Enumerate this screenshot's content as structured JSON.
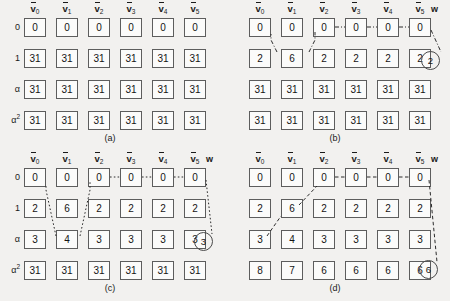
{
  "figure": {
    "background": "#f2f1ef",
    "cell_border": "#5d5d5d",
    "line_color": "#2b2b2b",
    "columns": [
      "0",
      "1",
      "2",
      "3",
      "4",
      "5"
    ],
    "column_symbol": "v",
    "row_labels": [
      "0",
      "1",
      "α",
      "α"
    ],
    "row_label_sup": [
      "",
      "",
      "",
      "2"
    ],
    "w_label": "w"
  },
  "panels": [
    {
      "id": "a",
      "caption": "(a)",
      "show_row_labels": true,
      "show_w": false,
      "circled_value": null,
      "rows": [
        {
          "label": "0",
          "sup": "",
          "values": [
            "0",
            "0",
            "0",
            "0",
            "0",
            "0"
          ]
        },
        {
          "label": "1",
          "sup": "",
          "values": [
            "31",
            "31",
            "31",
            "31",
            "31",
            "31"
          ]
        },
        {
          "label": "α",
          "sup": "",
          "values": [
            "31",
            "31",
            "31",
            "31",
            "31",
            "31"
          ]
        },
        {
          "label": "α",
          "sup": "2",
          "values": [
            "31",
            "31",
            "31",
            "31",
            "31",
            "31"
          ]
        }
      ]
    },
    {
      "id": "b",
      "caption": "(b)",
      "show_row_labels": false,
      "show_w": true,
      "circled_value": "2",
      "rows": [
        {
          "label": "0",
          "sup": "",
          "values": [
            "0",
            "0",
            "0",
            "0",
            "0",
            "0"
          ]
        },
        {
          "label": "1",
          "sup": "",
          "values": [
            "2",
            "6",
            "2",
            "2",
            "2",
            "2"
          ]
        },
        {
          "label": "α",
          "sup": "",
          "values": [
            "31",
            "31",
            "31",
            "31",
            "31",
            "31"
          ]
        },
        {
          "label": "α",
          "sup": "2",
          "values": [
            "31",
            "31",
            "31",
            "31",
            "31",
            "31"
          ]
        }
      ]
    },
    {
      "id": "c",
      "caption": "(c)",
      "show_row_labels": true,
      "show_w": true,
      "circled_value": "3",
      "rows": [
        {
          "label": "0",
          "sup": "",
          "values": [
            "0",
            "0",
            "0",
            "0",
            "0",
            "0"
          ]
        },
        {
          "label": "1",
          "sup": "",
          "values": [
            "2",
            "6",
            "2",
            "2",
            "2",
            "2"
          ]
        },
        {
          "label": "α",
          "sup": "",
          "values": [
            "3",
            "4",
            "3",
            "3",
            "3",
            "3"
          ]
        },
        {
          "label": "α",
          "sup": "2",
          "values": [
            "31",
            "31",
            "31",
            "31",
            "31",
            "31"
          ]
        }
      ]
    },
    {
      "id": "d",
      "caption": "(d)",
      "show_row_labels": false,
      "show_w": true,
      "circled_value": "6",
      "rows": [
        {
          "label": "0",
          "sup": "",
          "values": [
            "0",
            "0",
            "0",
            "0",
            "0",
            "0"
          ]
        },
        {
          "label": "1",
          "sup": "",
          "values": [
            "2",
            "6",
            "2",
            "2",
            "2",
            "2"
          ]
        },
        {
          "label": "α",
          "sup": "",
          "values": [
            "3",
            "4",
            "3",
            "3",
            "3",
            "3"
          ]
        },
        {
          "label": "α",
          "sup": "2",
          "values": [
            "8",
            "7",
            "6",
            "6",
            "6",
            "6"
          ]
        }
      ]
    }
  ]
}
